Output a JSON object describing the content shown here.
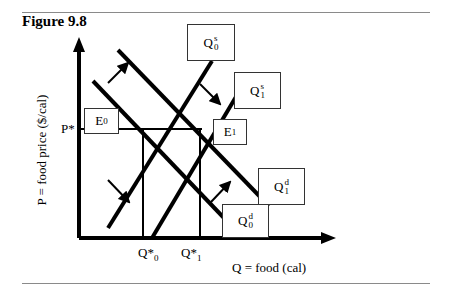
{
  "figure": {
    "title": "Figure 9.8",
    "y_axis_label": "P = food price ($/cal)",
    "x_axis_label": "Q = food (cal)",
    "price_tick": "P*",
    "quantity_ticks": [
      {
        "base": "Q*",
        "sub": "0"
      },
      {
        "base": "Q*",
        "sub": "1"
      }
    ],
    "curve_labels": {
      "supply_0": {
        "base": "Q",
        "sup": "s",
        "sub": "0"
      },
      "supply_1": {
        "base": "Q",
        "sup": "s",
        "sub": "1"
      },
      "demand_0": {
        "base": "Q",
        "sup": "d",
        "sub": "0"
      },
      "demand_1": {
        "base": "Q",
        "sup": "d",
        "sub": "1"
      }
    },
    "equilibria": [
      {
        "base": "E",
        "sub": "0"
      },
      {
        "base": "E",
        "sub": "1"
      }
    ]
  }
}
